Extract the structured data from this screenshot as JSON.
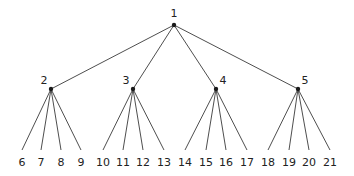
{
  "diagram": {
    "type": "tree",
    "root": {
      "id": "1",
      "label": "1",
      "x": 174,
      "y": 25,
      "label_x": 174,
      "label_y": 17,
      "anchor": "middle"
    },
    "internal": [
      {
        "id": "2",
        "label": "2",
        "x": 51,
        "y": 89,
        "label_x": 44,
        "label_y": 84,
        "anchor": "middle",
        "children": [
          {
            "label": "6",
            "x": 22
          },
          {
            "label": "7",
            "x": 41
          },
          {
            "label": "8",
            "x": 61
          },
          {
            "label": "9",
            "x": 81
          }
        ]
      },
      {
        "id": "3",
        "label": "3",
        "x": 133,
        "y": 89,
        "label_x": 126,
        "label_y": 84,
        "anchor": "middle",
        "children": [
          {
            "label": "10",
            "x": 103
          },
          {
            "label": "11",
            "x": 123
          },
          {
            "label": "12",
            "x": 143
          },
          {
            "label": "13",
            "x": 164
          }
        ]
      },
      {
        "id": "4",
        "label": "4",
        "x": 216,
        "y": 89,
        "label_x": 223,
        "label_y": 84,
        "anchor": "middle",
        "children": [
          {
            "label": "14",
            "x": 185
          },
          {
            "label": "15",
            "x": 206
          },
          {
            "label": "16",
            "x": 226
          },
          {
            "label": "17",
            "x": 247
          }
        ]
      },
      {
        "id": "5",
        "label": "5",
        "x": 298,
        "y": 89,
        "label_x": 305,
        "label_y": 84,
        "anchor": "middle",
        "children": [
          {
            "label": "18",
            "x": 268
          },
          {
            "label": "19",
            "x": 289
          },
          {
            "label": "20",
            "x": 309
          },
          {
            "label": "21",
            "x": 330
          }
        ]
      }
    ],
    "leaf_line_end_y": 150,
    "leaf_label_y": 166
  }
}
